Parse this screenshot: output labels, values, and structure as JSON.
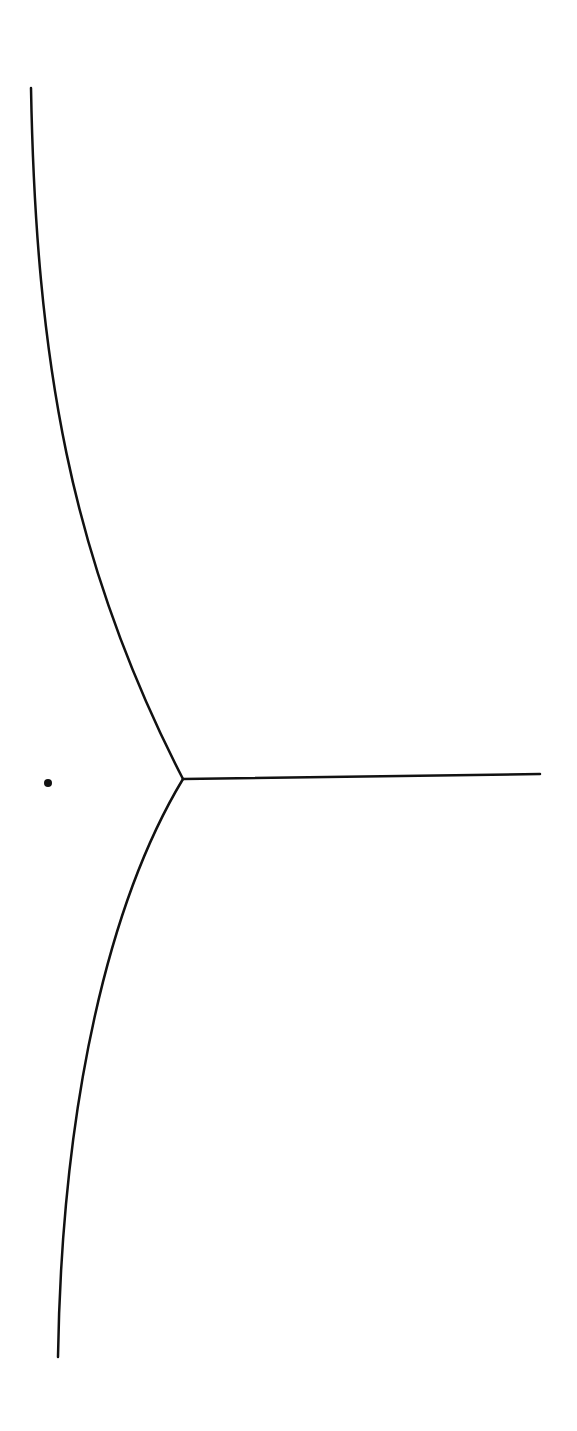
{
  "diagram": {
    "type": "line-drawing",
    "stroke_color": "#111111",
    "background": "#ffffff",
    "point": {
      "x": 48,
      "y": 783,
      "r": 4
    },
    "junction": {
      "x": 183,
      "y": 779
    },
    "branches": [
      {
        "name": "upper-curve",
        "path": "M31,88 C36,360 70,560 183,779"
      },
      {
        "name": "lower-curve",
        "path": "M183,779 C110,900 62,1100 58,1357"
      },
      {
        "name": "horizontal-line",
        "path": "M183,779 L540,774"
      }
    ]
  }
}
